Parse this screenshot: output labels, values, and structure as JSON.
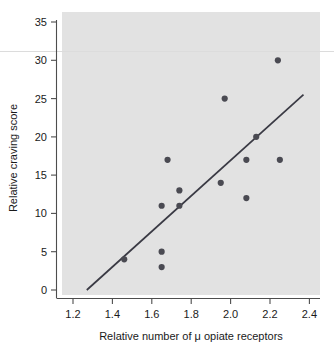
{
  "chart_data": {
    "type": "scatter",
    "title": "",
    "xlabel": "Relative number of μ opiate receptors",
    "ylabel": "Relative craving score",
    "xlim": [
      1.15,
      2.47
    ],
    "ylim": [
      -1.2,
      36.5
    ],
    "xticks": [
      "1.2",
      "1.4",
      "1.6",
      "1.8",
      "2.0",
      "2.2",
      "2.4"
    ],
    "xtick_values": [
      1.2,
      1.4,
      1.6,
      1.8,
      2.0,
      2.2,
      2.4
    ],
    "yticks": [
      "0",
      "5",
      "10",
      "15",
      "20",
      "25",
      "30",
      "35"
    ],
    "ytick_values": [
      0,
      5,
      10,
      15,
      20,
      25,
      30,
      35
    ],
    "grid": false,
    "legend": "none",
    "plot_background_color": "#e2e2e2",
    "point_color": "#4a4a52",
    "line_color": "#3a3a44",
    "x": [
      1.46,
      1.65,
      1.65,
      1.65,
      1.68,
      1.74,
      1.74,
      1.95,
      1.97,
      2.08,
      2.08,
      2.13,
      2.24,
      2.25
    ],
    "y": [
      4,
      5,
      3,
      11,
      17,
      13,
      11,
      14,
      25,
      17,
      12,
      20,
      30,
      17
    ],
    "points": [
      {
        "x": 1.46,
        "y": 4
      },
      {
        "x": 1.65,
        "y": 5
      },
      {
        "x": 1.65,
        "y": 3
      },
      {
        "x": 1.65,
        "y": 11
      },
      {
        "x": 1.68,
        "y": 17
      },
      {
        "x": 1.74,
        "y": 13
      },
      {
        "x": 1.74,
        "y": 11
      },
      {
        "x": 1.95,
        "y": 14
      },
      {
        "x": 1.97,
        "y": 25
      },
      {
        "x": 2.08,
        "y": 17
      },
      {
        "x": 2.08,
        "y": 12
      },
      {
        "x": 2.13,
        "y": 20
      },
      {
        "x": 2.24,
        "y": 30
      },
      {
        "x": 2.25,
        "y": 17
      }
    ],
    "fit_line": {
      "name": "regression line",
      "x_start": 1.27,
      "y_start": 0,
      "x_end": 2.37,
      "y_end": 25.5
    },
    "annotations": []
  }
}
